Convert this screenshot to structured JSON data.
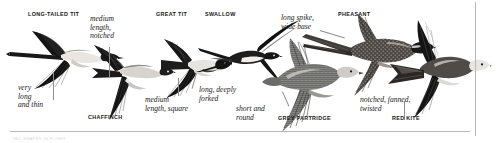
{
  "plate": {
    "title": "Tail shapes in flight",
    "background_color": "#ffffff",
    "ink_color": "#141414",
    "rule_color": "#b9b9b9",
    "leader_color": "#8e8e8e",
    "bottom_caption": "TAIL SHAPES IN FLIGHT"
  },
  "species": [
    {
      "id": "long-tailed-tit",
      "label": "LONG-TAILED TIT"
    },
    {
      "id": "chaffinch",
      "label": "CHAFFINCH"
    },
    {
      "id": "great-tit",
      "label": "GREAT TIT"
    },
    {
      "id": "swallow",
      "label": "SWALLOW"
    },
    {
      "id": "grey-partridge",
      "label": "GREY PARTRIDGE"
    },
    {
      "id": "pheasant",
      "label": "PHEASANT"
    },
    {
      "id": "red-kite",
      "label": "RED KITE"
    }
  ],
  "annotations": [
    {
      "id": "very-long-and-thin",
      "text": "very\nlong\nand thin",
      "for": "long-tailed-tit"
    },
    {
      "id": "medium-notched",
      "text": "medium\nlength,\nnotched",
      "for": "chaffinch"
    },
    {
      "id": "medium-square",
      "text": "medium\nlength, square",
      "for": "great-tit"
    },
    {
      "id": "long-deeply-forked",
      "text": "long, deeply\nforked",
      "for": "swallow"
    },
    {
      "id": "short-and-round",
      "text": "short and\nround",
      "for": "grey-partridge"
    },
    {
      "id": "long-spike-wide-base",
      "text": "long spike,\nwide base",
      "for": "pheasant"
    },
    {
      "id": "notched-fanned-twisted",
      "text": "notched, fanned,\ntwisted",
      "for": "red-kite"
    }
  ]
}
